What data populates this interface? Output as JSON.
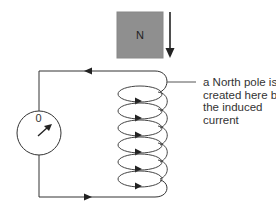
{
  "diagram": {
    "magnet": {
      "pole_label": "N",
      "color": "#8f8f8f",
      "motion": "down"
    },
    "meter": {
      "zero_label": "0",
      "needle_direction": "deflected right"
    },
    "coil": {
      "turns": 6,
      "current_direction": "right (front of each loop)"
    },
    "wires": {
      "top_arrow": "left",
      "bottom_arrow": "right"
    },
    "annotation": {
      "lines": [
        "a North pole is",
        "created here by",
        "the induced",
        "current"
      ]
    },
    "colors": {
      "line": "#333333",
      "magnet_fill": "#8f8f8f",
      "background": "#ffffff"
    }
  }
}
